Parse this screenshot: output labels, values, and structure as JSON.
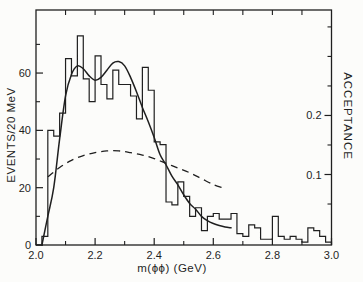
{
  "figure": {
    "background_color": "#fcfcfa",
    "ink_color": "#1f1f1f"
  },
  "chart_data": {
    "type": "bar",
    "subtype": "histogram-with-fit-and-acceptance-curve",
    "title": "",
    "xlabel": "m(ϕϕ) (GeV)",
    "ylabel_left": "EVENTS/20 MeV",
    "ylabel_right": "ACCEPTANCE",
    "x_range": [
      2.0,
      3.0
    ],
    "y_left_range": [
      0,
      82
    ],
    "grid": false,
    "legend": false,
    "x_major_ticks": [
      {
        "v": 2.0,
        "label": "2.0"
      },
      {
        "v": 2.2,
        "label": "2.2"
      },
      {
        "v": 2.4,
        "label": "2.4"
      },
      {
        "v": 2.6,
        "label": "2.6"
      },
      {
        "v": 2.8,
        "label": "2.8"
      },
      {
        "v": 3.0,
        "label": "3.0"
      }
    ],
    "x_minor_ticks": [
      2.1,
      2.3,
      2.5,
      2.7,
      2.9
    ],
    "top_ticks": [
      2.1,
      2.2,
      2.3,
      2.4,
      2.5,
      2.6,
      2.7,
      2.8,
      2.9
    ],
    "y_left_major_ticks": [
      {
        "v": 0,
        "label": "0"
      },
      {
        "v": 20,
        "label": "20"
      },
      {
        "v": 40,
        "label": "40"
      },
      {
        "v": 60,
        "label": "60"
      }
    ],
    "y_left_minor_ticks": [
      10,
      30,
      50,
      70
    ],
    "right_axis": {
      "unit": "acceptance",
      "major_ticks": [
        {
          "a": 0.1,
          "label": "0.1"
        },
        {
          "a": 0.2,
          "label": "0.2"
        }
      ],
      "minor_ticks": [
        0.05,
        0.15,
        0.25,
        0.3,
        0.35
      ],
      "events_per_acceptance_unit": 206,
      "acceptance_zero_offset_events": 4.0
    },
    "histogram": {
      "bin_start": 2.0,
      "bin_width": 0.02,
      "counts": [
        0,
        3,
        40,
        38,
        46,
        65,
        59,
        73,
        58,
        50,
        66,
        56,
        51,
        61,
        56,
        56,
        52,
        44,
        62,
        54,
        36,
        35,
        15,
        14,
        22,
        17,
        10,
        13,
        5,
        10,
        11,
        9,
        9,
        11,
        4,
        3,
        7,
        6,
        2,
        2,
        10,
        3,
        2,
        3,
        2,
        1,
        6,
        5,
        3,
        1
      ]
    },
    "fit_curve": {
      "style": "solid",
      "x": [
        2.02,
        2.04,
        2.06,
        2.08,
        2.1,
        2.12,
        2.14,
        2.16,
        2.18,
        2.2,
        2.22,
        2.24,
        2.26,
        2.28,
        2.3,
        2.32,
        2.34,
        2.36,
        2.38,
        2.4,
        2.42,
        2.44,
        2.46,
        2.48,
        2.5,
        2.52,
        2.54,
        2.56,
        2.58,
        2.6,
        2.62,
        2.64,
        2.66
      ],
      "y_events": [
        0,
        10,
        20,
        37,
        52,
        59.5,
        62.5,
        61.5,
        59,
        57.5,
        58.5,
        61,
        63.5,
        64,
        62.5,
        58.5,
        53.5,
        48,
        43,
        37.5,
        31.5,
        28,
        24,
        21,
        17.5,
        14.5,
        12.5,
        10,
        8.5,
        7.5,
        6.8,
        6.3,
        6
      ]
    },
    "acceptance_curve": {
      "style": "dashed",
      "x": [
        2.04,
        2.08,
        2.12,
        2.16,
        2.2,
        2.24,
        2.28,
        2.32,
        2.36,
        2.4,
        2.44,
        2.48,
        2.52,
        2.56,
        2.6,
        2.63
      ],
      "y_acceptance": [
        0.096,
        0.112,
        0.124,
        0.132,
        0.137,
        0.14,
        0.14,
        0.137,
        0.133,
        0.127,
        0.119,
        0.111,
        0.103,
        0.093,
        0.083,
        0.078
      ]
    }
  }
}
